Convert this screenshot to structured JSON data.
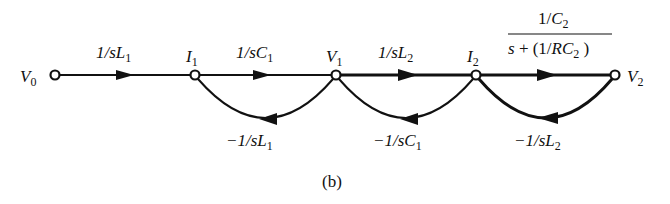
{
  "figure_label": "(b)",
  "nodes": {
    "v0": {
      "name": "V",
      "sub": "0"
    },
    "i1": {
      "name": "I",
      "sub": "1"
    },
    "v1": {
      "name": "V",
      "sub": "1"
    },
    "i2": {
      "name": "I",
      "sub": "2"
    },
    "v2": {
      "name": "V",
      "sub": "2"
    }
  },
  "forward_branches": {
    "v0_i1": {
      "pre": "1/s",
      "var": "L",
      "sub": "1"
    },
    "i1_v1": {
      "pre": "1/s",
      "var": "C",
      "sub": "1"
    },
    "v1_i2": {
      "pre": "1/s",
      "var": "L",
      "sub": "2"
    },
    "i2_v2": {
      "numerator": {
        "pre": "1/",
        "var": "C",
        "sub": "2"
      },
      "denominator": {
        "pre": "s + (1/",
        "var": "RC",
        "sub": "2",
        "post": ")"
      }
    }
  },
  "feedback_branches": {
    "i1_v0": {
      "pre": "−1/s",
      "var": "L",
      "sub": "1"
    },
    "v1_i1": {
      "pre": "−1/s",
      "var": "C",
      "sub": "1"
    },
    "v2_i2": {
      "pre": "−1/s",
      "var": "L",
      "sub": "2"
    }
  },
  "colors": {
    "ink": "#111111",
    "background": "#ffffff"
  }
}
